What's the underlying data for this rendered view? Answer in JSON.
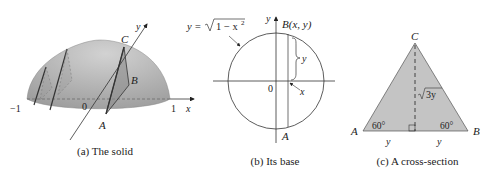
{
  "panels": [
    {
      "id": "a",
      "caption": "(a) The solid",
      "labels": {
        "C": "C",
        "B": "B",
        "A": "A",
        "y_axis": "y",
        "x_axis": "x",
        "origin": "0",
        "minus_one": "−1",
        "one": "1"
      }
    },
    {
      "id": "b",
      "caption": "(b) Its base",
      "labels": {
        "equation": "y = √1 − x²",
        "eq_lhs": "y =",
        "eq_rad": "1 − x",
        "eq_exp": "2",
        "point_B": "B(x, y)",
        "y_axis": "y",
        "origin": "0",
        "A": "A",
        "seg_y": "y",
        "seg_x": "x"
      }
    },
    {
      "id": "c",
      "caption": "(c) A cross-section",
      "labels": {
        "C": "C",
        "A": "A",
        "B": "B",
        "height": "3y",
        "angle_left": "60°",
        "angle_right": "60°",
        "base_left": "y",
        "base_right": "y"
      }
    }
  ],
  "colors": {
    "solid_fill": "#b4b4b4",
    "triangle_fill": "#c4c4c4",
    "stroke": "#333333"
  }
}
